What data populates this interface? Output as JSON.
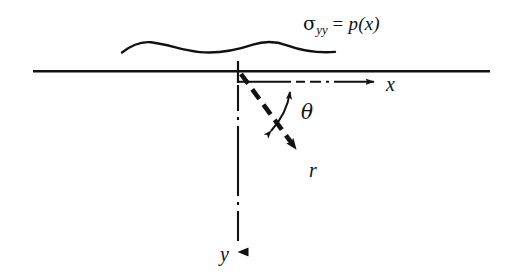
{
  "figure": {
    "caption_labels": {
      "stress_symbol": "σ",
      "stress_subscript": "yy",
      "equals": " = ",
      "pressure_function": "p(x)",
      "full_text": "σyy = p(x)"
    },
    "axis_labels": {
      "x_axis": "x",
      "y_axis": "y",
      "radial": "r",
      "angle": "θ"
    },
    "colors": {
      "ink": "#111111",
      "background": "#ffffff"
    },
    "geometry": {
      "origin": {
        "x": 238,
        "y": 71
      },
      "surface_line": {
        "x1": 33,
        "y1": 71,
        "x2": 490,
        "y2": 71
      },
      "x_axis_arrow_tip": {
        "x": 377,
        "y": 82
      },
      "y_axis_arrow_tip": {
        "x": 238,
        "y": 264
      },
      "r_arrow_tip": {
        "x": 303,
        "y": 156
      },
      "theta_degrees": 45
    }
  }
}
